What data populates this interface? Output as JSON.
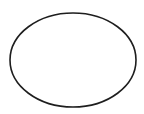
{
  "canvas": {
    "width": 144,
    "height": 114,
    "background": "#ffffff"
  },
  "shapes": [
    {
      "type": "ellipse",
      "cx": 73,
      "cy": 60,
      "rx": 63,
      "ry": 47,
      "stroke": "#1e1e1e",
      "stroke_width": 1.6,
      "fill": "none"
    }
  ]
}
